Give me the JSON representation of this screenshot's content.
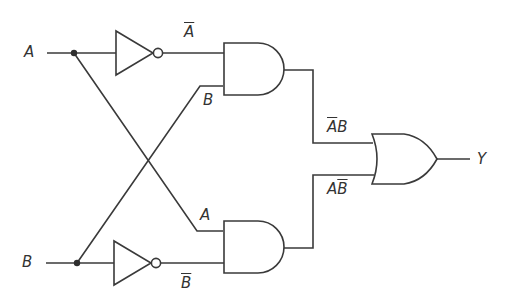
{
  "diagram": {
    "type": "logic-circuit",
    "function": "XOR",
    "inputs": [
      {
        "id": "A",
        "label": "A"
      },
      {
        "id": "B",
        "label": "B"
      }
    ],
    "output": {
      "id": "Y",
      "label": "Y"
    },
    "gates": [
      {
        "id": "inv-a",
        "type": "NOT",
        "input": "A",
        "output_label": "A",
        "output_negated": true
      },
      {
        "id": "inv-b",
        "type": "NOT",
        "input": "B",
        "output_label": "B",
        "output_negated": true
      },
      {
        "id": "and-top",
        "type": "AND",
        "inputs": [
          "Ā",
          "B"
        ],
        "output_label_parts": {
          "neg": "A",
          "pos": "B"
        }
      },
      {
        "id": "and-bottom",
        "type": "AND",
        "inputs": [
          "A",
          "B̄"
        ],
        "output_label_parts": {
          "pos": "A",
          "neg": "B"
        }
      },
      {
        "id": "or-out",
        "type": "OR",
        "inputs": [
          "ĀB",
          "AB̄"
        ],
        "output": "Y"
      }
    ],
    "labels": {
      "input_a": "A",
      "input_b": "B",
      "not_a": "A",
      "not_b": "B",
      "and_top_in_b": "B",
      "and_bottom_in_a": "A",
      "ab_not_a": "A",
      "ab_b": "B",
      "anb_a": "A",
      "anb_not_b": "B",
      "output_y": "Y"
    },
    "colors": {
      "line": "#3a3a3a",
      "background": "#ffffff"
    }
  }
}
